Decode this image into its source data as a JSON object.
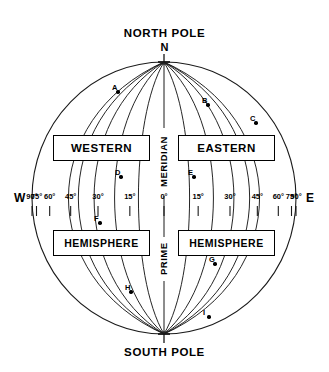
{
  "diagram": {
    "title_north": "NORTH POLE",
    "title_south": "SOUTH POLE",
    "pole_letter_north": "N",
    "direction_west": "W",
    "direction_east": "E",
    "vertical_labels": {
      "meridian": "MERIDIAN",
      "prime": "PRIME"
    },
    "boxes": {
      "western": "WESTERN",
      "eastern": "EASTERN",
      "hemisphere_west": "HEMISPHERE",
      "hemisphere_east": "HEMISPHERE"
    },
    "longitude_ticks_west": [
      "90°",
      "75°",
      "60°",
      "45°",
      "30°",
      "15°"
    ],
    "longitude_center_tick": "0°",
    "longitude_ticks_east": [
      "15°",
      "30°",
      "45°",
      "60°",
      "75°",
      "90°"
    ],
    "marked_points": [
      {
        "label": "A",
        "x": 118,
        "y": 92
      },
      {
        "label": "B",
        "x": 208,
        "y": 105
      },
      {
        "label": "C",
        "x": 256,
        "y": 123
      },
      {
        "label": "D",
        "x": 121,
        "y": 177
      },
      {
        "label": "E",
        "x": 194,
        "y": 177
      },
      {
        "label": "F",
        "x": 100,
        "y": 223
      },
      {
        "label": "G",
        "x": 215,
        "y": 264
      },
      {
        "label": "H",
        "x": 131,
        "y": 292
      },
      {
        "label": "I",
        "x": 209,
        "y": 317
      }
    ],
    "colors": {
      "line": "#1a1a1a",
      "text": "#000000",
      "background": "#ffffff"
    }
  }
}
